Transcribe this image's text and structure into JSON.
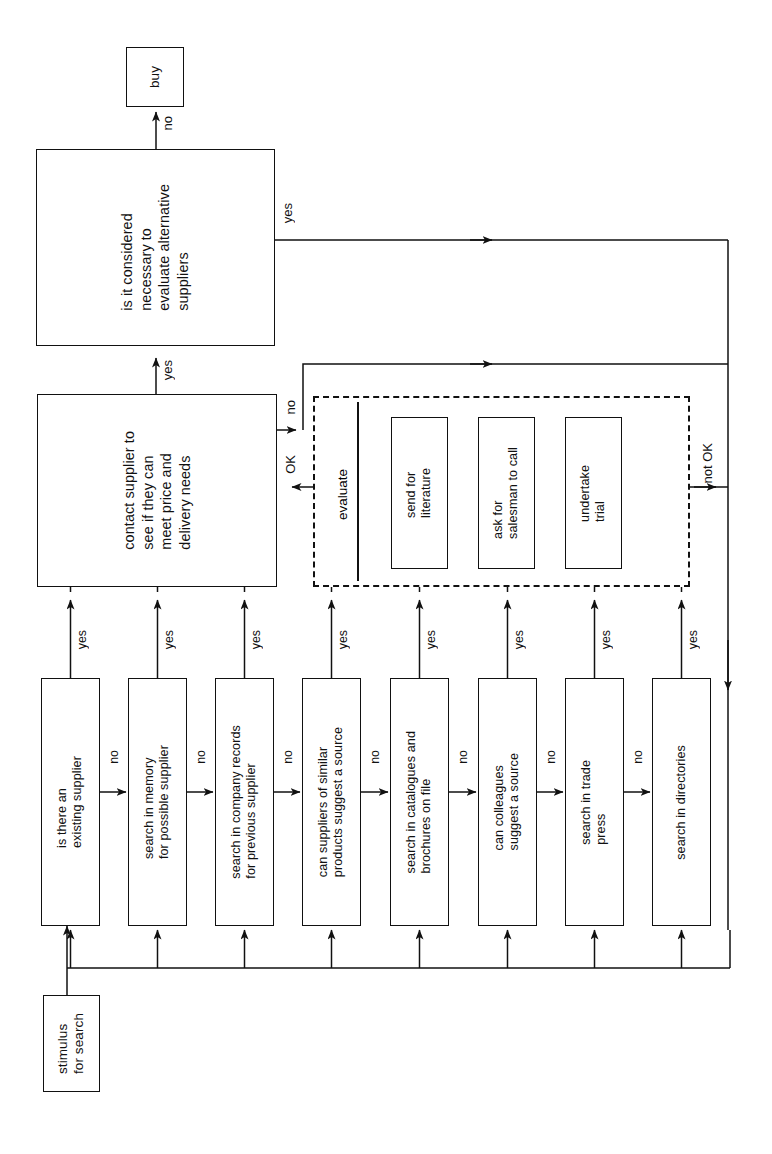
{
  "diagram": {
    "orientation": "rotated-90-ccw",
    "stroke_color": "#111111",
    "background_color": "#ffffff"
  },
  "nodes": {
    "buy": "buy",
    "evaluate_alternatives": "is it considered\nnecessary to\nevaluate alternative\nsuppliers",
    "contact_supplier": "contact supplier to\nsee if they can\nmeet price and\ndelivery needs",
    "evaluate_group_label": "evaluate",
    "send_for_literature": "send for\nliterature",
    "ask_salesman": "ask for\nsalesman to call",
    "undertake_trial": "undertake\ntrial",
    "stimulus": "stimulus\nfor search"
  },
  "search_steps": [
    {
      "id": "existing-supplier",
      "text": "is there an\nexisting supplier"
    },
    {
      "id": "memory",
      "text": "search in memory\nfor possible supplier"
    },
    {
      "id": "company-records",
      "text": "search in company records\nfor previous supplier"
    },
    {
      "id": "similar-products",
      "text": "can suppliers of similar\nproducts suggest a source"
    },
    {
      "id": "catalogues",
      "text": "search in catalogues and\nbrochures on file"
    },
    {
      "id": "colleagues",
      "text": "can colleagues\nsuggest a source"
    },
    {
      "id": "trade-press",
      "text": "search in trade\npress"
    },
    {
      "id": "directories",
      "text": "search in directories"
    }
  ],
  "edge_labels": {
    "buy_no": "no",
    "alternatives_yes": "yes",
    "contact_yes": "yes",
    "contact_no": "no",
    "evaluate_ok": "OK",
    "evaluate_not_ok": "not OK",
    "step_yes": "yes",
    "step_no": "no"
  },
  "step_edge_labels": [
    {
      "yes": "yes",
      "no": "no"
    },
    {
      "yes": "yes",
      "no": "no"
    },
    {
      "yes": "yes",
      "no": "no"
    },
    {
      "yes": "yes",
      "no": "no"
    },
    {
      "yes": "yes",
      "no": "no"
    },
    {
      "yes": "yes",
      "no": "no"
    },
    {
      "yes": "yes",
      "no": "no"
    },
    {
      "yes": "yes",
      "no": ""
    }
  ]
}
